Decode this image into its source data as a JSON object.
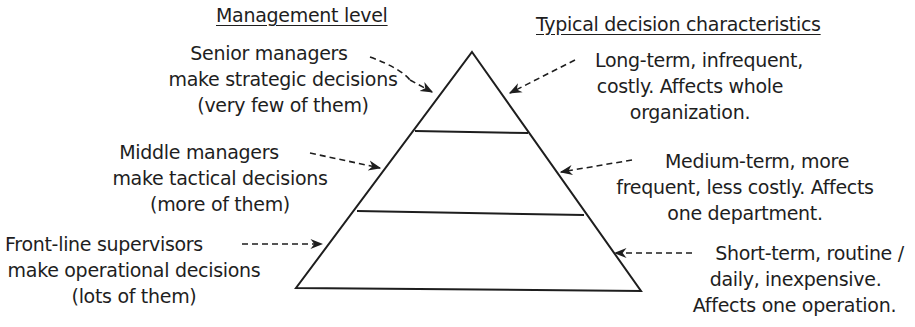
{
  "headings": {
    "left": "Management level",
    "right": "Typical decision characteristics"
  },
  "levels": [
    {
      "name": "senior",
      "management": [
        "Senior managers",
        "make strategic decisions",
        "(very few of them)"
      ],
      "characteristics": [
        "Long-term, infrequent,",
        "costly. Affects whole",
        "organization."
      ]
    },
    {
      "name": "middle",
      "management": [
        "Middle managers",
        "make tactical decisions",
        "(more of them)"
      ],
      "characteristics": [
        "Medium-term, more",
        "frequent, less costly. Affects",
        "one department."
      ]
    },
    {
      "name": "front-line",
      "management": [
        "Front-line supervisors",
        "make operational decisions",
        "(lots of them)"
      ],
      "characteristics": [
        "Short-term, routine /",
        "daily, inexpensive.",
        "Affects one operation."
      ]
    }
  ],
  "colors": {
    "ink": "#1e1e1e",
    "background": "#ffffff"
  }
}
